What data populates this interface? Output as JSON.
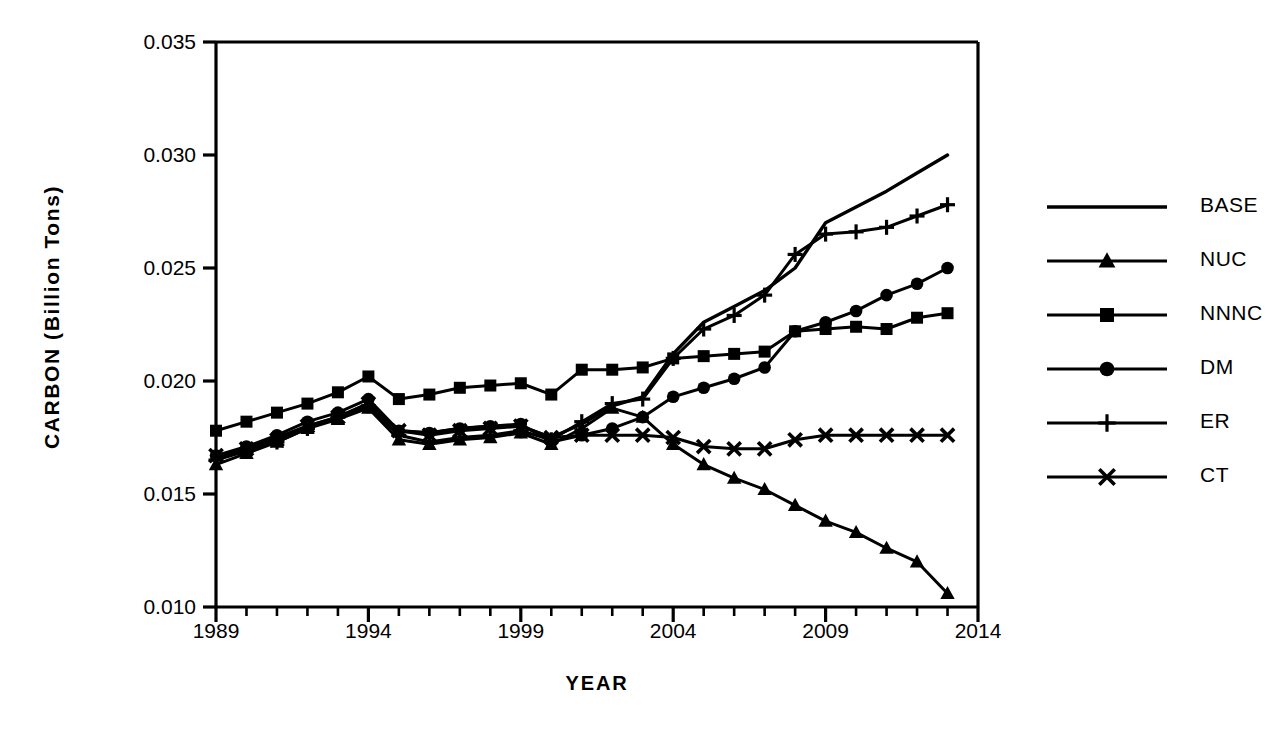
{
  "chart_data": {
    "type": "line",
    "title": "",
    "xlabel": "YEAR",
    "ylabel": "CARBON (Billion Tons)",
    "xlim": [
      1989,
      2014
    ],
    "ylim": [
      0.01,
      0.035
    ],
    "x_ticks": [
      1989,
      1994,
      1999,
      2004,
      2009,
      2014
    ],
    "x_tick_labels": [
      "1989",
      "1994",
      "1999",
      "2004",
      "2009",
      "2014"
    ],
    "x_minor_tick_step": 1,
    "y_ticks": [
      0.01,
      0.015,
      0.02,
      0.025,
      0.03,
      0.035
    ],
    "y_tick_labels": [
      "0.010",
      "0.015",
      "0.020",
      "0.025",
      "0.030",
      "0.035"
    ],
    "grid": false,
    "legend_position": "right",
    "line_color": "#000000",
    "x": [
      1989,
      1990,
      1991,
      1992,
      1993,
      1994,
      1995,
      1996,
      1997,
      1998,
      1999,
      2000,
      2001,
      2002,
      2003,
      2004,
      2005,
      2006,
      2007,
      2008,
      2009,
      2010,
      2011,
      2012,
      2013
    ],
    "series": [
      {
        "name": "BASE",
        "marker": "none",
        "values": [
          0.0166,
          0.017,
          0.0175,
          0.018,
          0.0184,
          0.019,
          0.0178,
          0.0177,
          0.0179,
          0.018,
          0.018,
          0.0175,
          0.0181,
          0.0189,
          0.0193,
          0.0212,
          0.0226,
          0.0233,
          0.024,
          0.025,
          0.027,
          0.0277,
          0.0284,
          0.0292,
          0.03
        ]
      },
      {
        "name": "NUC",
        "marker": "triangle",
        "values": [
          0.0163,
          0.0168,
          0.0173,
          0.0179,
          0.0183,
          0.0188,
          0.0174,
          0.0172,
          0.0174,
          0.0175,
          0.0177,
          0.0172,
          0.0179,
          0.0188,
          0.0184,
          0.0172,
          0.0163,
          0.0157,
          0.0152,
          0.0145,
          0.0138,
          0.0133,
          0.0126,
          0.012,
          0.0106
        ]
      },
      {
        "name": "NNNC",
        "marker": "square",
        "values": [
          0.0178,
          0.0182,
          0.0186,
          0.019,
          0.0195,
          0.0202,
          0.0192,
          0.0194,
          0.0197,
          0.0198,
          0.0199,
          0.0194,
          0.0205,
          0.0205,
          0.0206,
          0.021,
          0.0211,
          0.0212,
          0.0213,
          0.0222,
          0.0223,
          0.0224,
          0.0223,
          0.0228,
          0.023
        ]
      },
      {
        "name": "DM",
        "marker": "circle",
        "values": [
          0.0167,
          0.0171,
          0.0176,
          0.0182,
          0.0186,
          0.0192,
          0.0178,
          0.0177,
          0.0179,
          0.018,
          0.0181,
          0.0173,
          0.0176,
          0.0179,
          0.0184,
          0.0193,
          0.0197,
          0.0201,
          0.0206,
          0.0222,
          0.0226,
          0.0231,
          0.0238,
          0.0243,
          0.025
        ]
      },
      {
        "name": "ER",
        "marker": "plus",
        "values": [
          0.0165,
          0.0169,
          0.0173,
          0.0179,
          0.0184,
          0.0189,
          0.0176,
          0.0173,
          0.0175,
          0.0176,
          0.0178,
          0.0174,
          0.0182,
          0.019,
          0.0192,
          0.021,
          0.0223,
          0.0229,
          0.0238,
          0.0256,
          0.0265,
          0.0266,
          0.0268,
          0.0273,
          0.0278
        ]
      },
      {
        "name": "CT",
        "marker": "cross",
        "values": [
          0.0167,
          0.017,
          0.0174,
          0.018,
          0.0184,
          0.019,
          0.0178,
          0.0176,
          0.0178,
          0.0179,
          0.018,
          0.0175,
          0.0176,
          0.0176,
          0.0176,
          0.0175,
          0.0171,
          0.017,
          0.017,
          0.0174,
          0.0176,
          0.0176,
          0.0176,
          0.0176,
          0.0176
        ]
      }
    ]
  },
  "legend": {
    "items": [
      {
        "label": "BASE",
        "marker": "none"
      },
      {
        "label": "NUC",
        "marker": "triangle"
      },
      {
        "label": "NNNC",
        "marker": "square"
      },
      {
        "label": "DM",
        "marker": "circle"
      },
      {
        "label": "ER",
        "marker": "plus"
      },
      {
        "label": "CT",
        "marker": "cross"
      }
    ]
  }
}
